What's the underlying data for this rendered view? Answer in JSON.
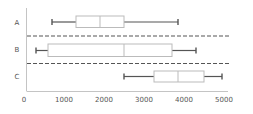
{
  "chart_data": {
    "type": "boxplot",
    "orientation": "horizontal",
    "title": "",
    "xlabel": "",
    "ylabel": "",
    "xlim": [
      0,
      5000
    ],
    "x_ticks": [
      0,
      1000,
      2000,
      3000,
      4000,
      5000
    ],
    "x_tick_labels": [
      "0",
      "1000",
      "2000",
      "3000",
      "4000",
      "5000"
    ],
    "categories": [
      "A",
      "B",
      "C"
    ],
    "series": [
      {
        "name": "A",
        "min": 700,
        "q1": 1300,
        "median": 1900,
        "q3": 2500,
        "max": 3850
      },
      {
        "name": "B",
        "min": 300,
        "q1": 600,
        "median": 2500,
        "q3": 3700,
        "max": 4300
      },
      {
        "name": "C",
        "min": 2500,
        "q1": 3250,
        "median": 3850,
        "q3": 4500,
        "max": 4950
      }
    ],
    "separators": "dashed lines between categories",
    "grid": false,
    "legend": "none"
  },
  "colors": {
    "box_outline": "#bbbbbb",
    "whisker": "#555555",
    "separator": "#555555",
    "axis": "#bbbbbb",
    "text": "#555555"
  }
}
